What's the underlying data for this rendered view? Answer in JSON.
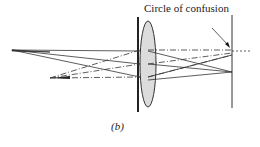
{
  "diagram": {
    "annotation": "Circle of confusion",
    "caption": "(b)",
    "elements": [
      "object arrow",
      "second object arrow",
      "aperture stop",
      "convex lens",
      "image screen"
    ],
    "colors": {
      "line": "#333333",
      "lens_fill": "#dcdcdc"
    }
  }
}
